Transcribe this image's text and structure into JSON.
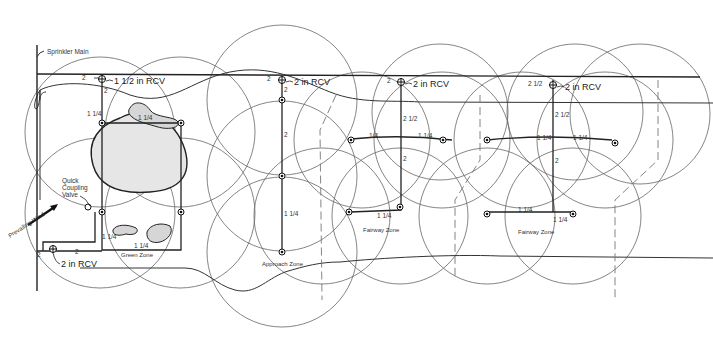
{
  "diagram": {
    "type": "golf-course-irrigation-plan",
    "labels": {
      "sprinkler_main": "Sprinkler Main",
      "quick_coupling_valve_1": "Quick",
      "quick_coupling_valve_2": "Coupling",
      "quick_coupling_valve_3": "Valve",
      "prevailing_wind": "Prevailing Wind",
      "green_zone": "Green Zone",
      "approach_zone": "Approach Zone",
      "fairway_zone_1": "Fairway Zone",
      "fairway_zone_2": "Fairway Zone"
    },
    "valves": [
      {
        "label": "1 1/2 in RCV",
        "main_size": "2"
      },
      {
        "label": "2 in RCV",
        "main_size": "2"
      },
      {
        "label": "2 in RCV",
        "main_size": "2"
      },
      {
        "label": "2 in RCV",
        "main_size": "2 1/2"
      },
      {
        "label": "2 in RCV",
        "main_size": "2"
      }
    ],
    "pipe_sizes": {
      "green_lateral_down": "2",
      "green_top": "1 1/4",
      "green_left": "1 1/4",
      "green_bottom": "1 1/4",
      "green_left_low": "1 1/4",
      "green_low_2": "2",
      "approach_upper": "2",
      "approach_mid": "2",
      "approach_lower": "1 1/4",
      "fairway1_upper": "2 1/2",
      "fairway1_left": "1/4",
      "fairway1_right": "1 1/4",
      "fairway1_mid": "2",
      "fairway1_bottom": "1 1/4",
      "fairway2_upper": "2 1/2",
      "fairway2_left": "1 1/4",
      "fairway2_right": "1 1/4",
      "fairway2_mid": "2",
      "fairway2_bottom_left": "1 1/4",
      "fairway2_bottom_right": "1 1/4"
    }
  }
}
